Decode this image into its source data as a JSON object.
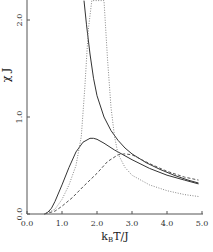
{
  "chart_data": {
    "type": "line",
    "title": "",
    "xlabel": "k_B T/J",
    "ylabel": "χ J",
    "xlim": [
      0.0,
      5.0
    ],
    "ylim": [
      0.0,
      2.2
    ],
    "grid": false,
    "legend": null,
    "x_ticks": [
      "0.0",
      "1.0",
      "2.0",
      "3.0",
      "4.0",
      "5.0"
    ],
    "y_ticks": [
      "0.0",
      "1.0",
      "2.0"
    ],
    "series": [
      {
        "name": "solid-divergent",
        "style": "solid",
        "x": [
          1.63,
          1.7,
          1.8,
          1.9,
          2.0,
          2.2,
          2.4,
          2.6,
          2.8,
          3.0,
          3.4,
          3.8,
          4.2,
          4.6,
          4.9
        ],
        "y": [
          2.2,
          1.95,
          1.65,
          1.4,
          1.22,
          1.0,
          0.86,
          0.76,
          0.68,
          0.62,
          0.53,
          0.46,
          0.4,
          0.35,
          0.32
        ]
      },
      {
        "name": "solid-peaked",
        "style": "solid",
        "x": [
          0.5,
          0.6,
          0.7,
          0.8,
          1.0,
          1.2,
          1.4,
          1.6,
          1.8,
          1.9,
          2.0,
          2.2,
          2.5,
          3.0,
          3.5,
          4.0,
          4.5,
          4.9
        ],
        "y": [
          0.0,
          0.02,
          0.06,
          0.13,
          0.3,
          0.48,
          0.64,
          0.74,
          0.78,
          0.78,
          0.77,
          0.73,
          0.66,
          0.56,
          0.47,
          0.4,
          0.35,
          0.31
        ]
      },
      {
        "name": "dashed",
        "style": "dashed",
        "x": [
          0.5,
          0.8,
          1.0,
          1.3,
          1.6,
          2.0,
          2.3,
          2.6,
          2.8,
          3.0,
          3.5,
          4.0,
          4.5,
          4.9
        ],
        "y": [
          0.0,
          0.03,
          0.08,
          0.17,
          0.28,
          0.42,
          0.54,
          0.61,
          0.62,
          0.61,
          0.52,
          0.44,
          0.38,
          0.35
        ]
      },
      {
        "name": "dotted",
        "style": "dotted",
        "x": [
          0.5,
          0.8,
          1.0,
          1.2,
          1.4,
          1.55,
          1.65,
          1.75,
          1.85,
          2.2,
          2.3,
          2.4,
          2.5,
          2.6,
          2.8,
          3.0,
          3.5,
          4.0,
          4.5,
          4.9
        ],
        "y": [
          0.0,
          0.05,
          0.15,
          0.3,
          0.5,
          0.8,
          1.3,
          1.9,
          2.2,
          2.2,
          1.6,
          1.1,
          0.8,
          0.62,
          0.48,
          0.4,
          0.3,
          0.24,
          0.2,
          0.18
        ]
      }
    ]
  },
  "axes": {
    "xlabel_main": "k",
    "xlabel_sub": "B",
    "xlabel_rest": "T/J",
    "ylabel": "χ J"
  }
}
